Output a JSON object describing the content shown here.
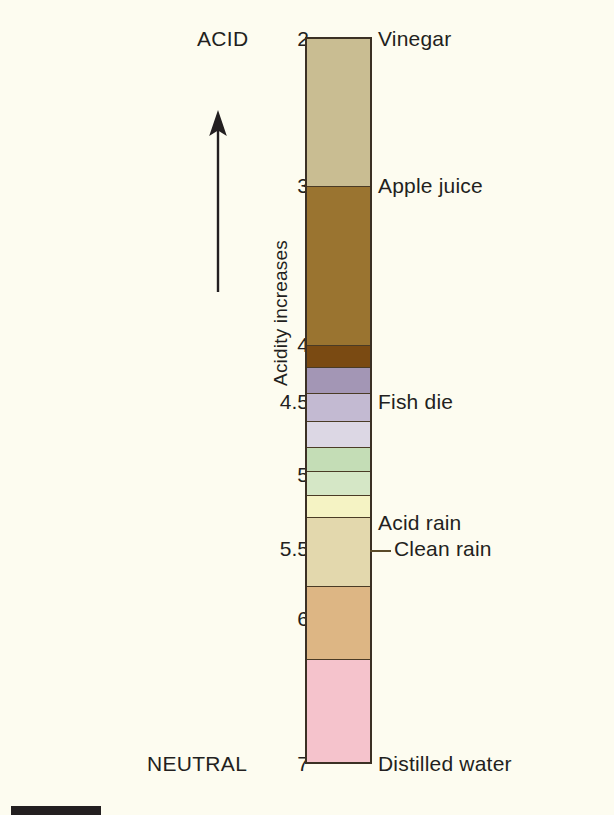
{
  "figure": {
    "kind": "ph-acidity-scale",
    "background_color": "#fdfcf0",
    "axis": {
      "arrow_label": "Acidity increases",
      "arrow_direction": "up",
      "top_endpoint": "ACID",
      "bottom_endpoint": "NEUTRAL"
    },
    "column": {
      "border_color": "#3b3024",
      "top_value": 2,
      "bottom_value": 7
    }
  },
  "chart_data": {
    "type": "bar",
    "xlabel": "",
    "ylabel": "Acidity increases",
    "ylim": [
      2,
      7
    ],
    "axis_inverted": true,
    "grid": false,
    "legend": "none",
    "tick_labels": [
      "2",
      "3",
      "4",
      "4.5",
      "5",
      "5.5",
      "6",
      "7"
    ],
    "tick_values": [
      2,
      3,
      4,
      4.5,
      5,
      5.5,
      6,
      7
    ],
    "annotations": [
      "ACID",
      "NEUTRAL",
      "Acidity increases"
    ],
    "categories": [
      "Vinegar",
      "Apple juice",
      "band-4.0",
      "band-4.1",
      "band-4.3",
      "Fish die",
      "band-4.6",
      "band-4.75",
      "band-4.9",
      "Acid rain",
      "Clean rain",
      "Distilled water"
    ],
    "bands": [
      {
        "label": "Vinegar",
        "ph_start": 2.0,
        "ph_end": 3.0,
        "color": "#c9bd92"
      },
      {
        "label": "Apple juice",
        "ph_start": 3.0,
        "ph_end": 3.95,
        "color": "#9a7430"
      },
      {
        "label": "",
        "ph_start": 3.95,
        "ph_end": 4.12,
        "color": "#7a4a12"
      },
      {
        "label": "",
        "ph_start": 4.12,
        "ph_end": 4.3,
        "color": "#a396b5"
      },
      {
        "label": "",
        "ph_start": 4.3,
        "ph_end": 4.48,
        "color": "#c3bad2"
      },
      {
        "label": "Fish die",
        "ph_start": 4.48,
        "ph_end": 4.63,
        "color": "#dcd7e4"
      },
      {
        "label": "",
        "ph_start": 4.63,
        "ph_end": 4.78,
        "color": "#c4ddb6"
      },
      {
        "label": "",
        "ph_start": 4.78,
        "ph_end": 4.9,
        "color": "#d5e7c6"
      },
      {
        "label": "",
        "ph_start": 4.9,
        "ph_end": 5.0,
        "color": "#f5f3c4"
      },
      {
        "label": "Acid rain",
        "ph_start": 5.0,
        "ph_end": 5.5,
        "color": "#e3d8ad"
      },
      {
        "label": "Clean rain",
        "ph_start": 5.5,
        "ph_end": 6.0,
        "color": "#ddb684"
      },
      {
        "label": "Distilled water",
        "ph_start": 6.0,
        "ph_end": 7.0,
        "color": "#f5c3cc"
      }
    ]
  },
  "ticks": [
    {
      "text": "2",
      "top": 27,
      "right_offset": 309
    },
    {
      "text": "3",
      "top": 174,
      "right_offset": 309
    },
    {
      "text": "4",
      "top": 333,
      "right_offset": 309
    },
    {
      "text": "4.5",
      "top": 390,
      "right_offset": 309
    },
    {
      "text": "5",
      "top": 463,
      "right_offset": 309
    },
    {
      "text": "5.5",
      "top": 537,
      "right_offset": 309
    },
    {
      "text": "6",
      "top": 607,
      "right_offset": 309
    },
    {
      "text": "7",
      "top": 752,
      "right_offset": 309
    }
  ],
  "bands_geometry": [
    {
      "name": "vinegar",
      "top": 0,
      "height": 148,
      "color": "#c9bd92",
      "sep": true
    },
    {
      "name": "apple-juice",
      "top": 148,
      "height": 159,
      "color": "#9a7430",
      "sep": true
    },
    {
      "name": "dark-brown",
      "top": 307,
      "height": 22,
      "color": "#7a4a12",
      "sep": true
    },
    {
      "name": "purple",
      "top": 329,
      "height": 26,
      "color": "#a396b5",
      "sep": true
    },
    {
      "name": "light-purple",
      "top": 355,
      "height": 28,
      "color": "#c3bad2",
      "sep": true
    },
    {
      "name": "pale-lavender",
      "top": 383,
      "height": 26,
      "color": "#dcd7e4",
      "sep": true
    },
    {
      "name": "green",
      "top": 409,
      "height": 24,
      "color": "#c4ddb6",
      "sep": true
    },
    {
      "name": "pale-green",
      "top": 433,
      "height": 24,
      "color": "#d5e7c6",
      "sep": true
    },
    {
      "name": "pale-yellow",
      "top": 457,
      "height": 22,
      "color": "#f5f3c4",
      "sep": true
    },
    {
      "name": "acid-rain",
      "top": 479,
      "height": 69,
      "color": "#e3d8ad",
      "sep": true
    },
    {
      "name": "clean-rain",
      "top": 548,
      "height": 73,
      "color": "#ddb684",
      "sep": true
    },
    {
      "name": "distilled-water",
      "top": 621,
      "height": 102,
      "color": "#f5c3cc",
      "sep": false
    }
  ],
  "item_labels": [
    {
      "text": "Vinegar",
      "left": 378,
      "top": 27,
      "leader": false
    },
    {
      "text": "Apple juice",
      "left": 378,
      "top": 174,
      "leader": false
    },
    {
      "text": "Fish die",
      "left": 378,
      "top": 390,
      "leader": false
    },
    {
      "text": "Acid rain",
      "left": 378,
      "top": 511,
      "leader": false
    },
    {
      "text": "Clean rain",
      "left": 394,
      "top": 537,
      "leader": true
    },
    {
      "text": "Distilled water",
      "left": 378,
      "top": 752,
      "leader": false
    }
  ]
}
